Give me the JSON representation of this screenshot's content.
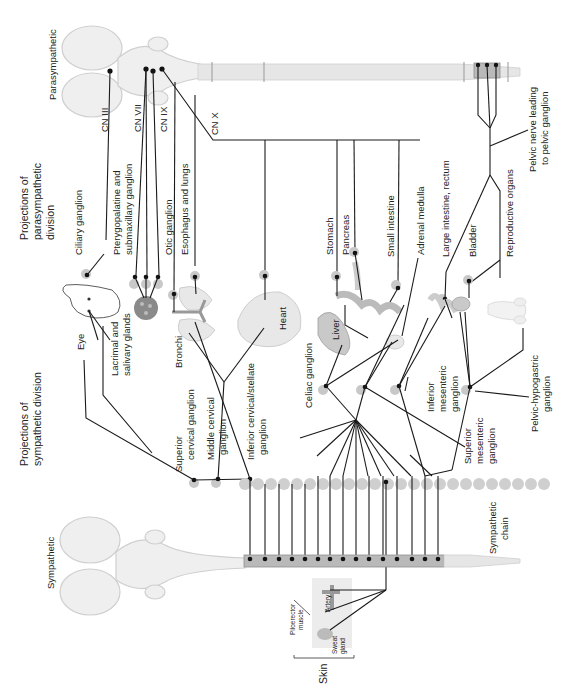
{
  "figure": {
    "orientation": "rotated-90-clockwise",
    "divisions": {
      "parasympathetic": "Parasympathetic",
      "sympathetic": "Sympathetic"
    },
    "headings": {
      "parasympathetic_projections": [
        "Projections of",
        "parasympathetic",
        "division"
      ],
      "sympathetic_projections": [
        "Projections of",
        "sympathetic division"
      ]
    },
    "cranial_nerves": [
      "CN III",
      "CN VII",
      "CN IX",
      "CN X"
    ],
    "parasympathetic_targets": {
      "ciliary": "Ciliary ganglion",
      "pterygo": [
        "Pterygopalatine and",
        "submaxillary ganglion"
      ],
      "otic": "Otic ganglion",
      "esophagus": "Esophagus and lungs",
      "stomach": "Stomach",
      "pancreas": "Pancreas",
      "small_intestine": "Small intestine",
      "adrenal": "Adrenal medulla",
      "large_intestine": "Large intestine, rectum",
      "bladder": "Bladder",
      "reproductive": "Reproductive organs",
      "pelvic_nerve": [
        "Pelvic nerve leading",
        "to pelvic ganglion"
      ]
    },
    "organs": {
      "eye": "Eye",
      "lacrimal": [
        "Lacrimal and",
        "salivary glands"
      ],
      "bronchi": "Bronchi",
      "heart": "Heart",
      "liver": "Liver"
    },
    "sympathetic_ganglia": {
      "superior_cervical": [
        "Superior",
        "cervical ganglion"
      ],
      "middle_cervical": [
        "Middle cervical",
        "ganglion"
      ],
      "inferior_cervical": [
        "Inferior cervical/stellate",
        "ganglion"
      ],
      "celiac": "Celiac ganglion",
      "superior_mesenteric": [
        "Superior",
        "mesenteric",
        "ganglion"
      ],
      "inferior_mesenteric": [
        "Inferior",
        "mesenteric",
        "ganglion"
      ],
      "pelvic_hypogastric": [
        "Pelvic-hypogastric",
        "ganglion"
      ],
      "chain": [
        "Sympathetic",
        "chain"
      ]
    },
    "skin": {
      "label": "Skin",
      "artery": "Artery",
      "piloerector": [
        "Piloerector",
        "muscle"
      ],
      "sweat": [
        "Sweat",
        "gland"
      ]
    }
  }
}
